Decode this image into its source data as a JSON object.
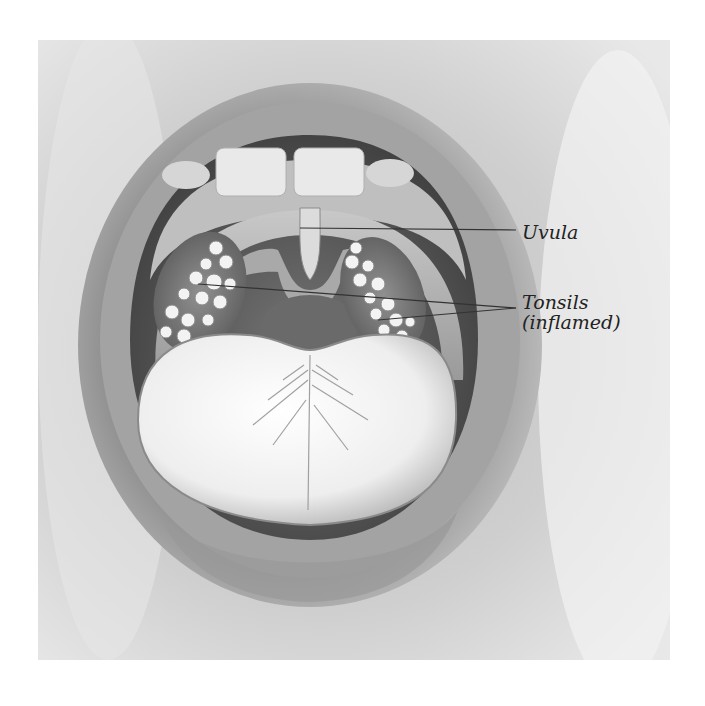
{
  "figure": {
    "style": "grayscale pencil illustration"
  },
  "labels": [
    {
      "id": "uvula",
      "text": "Uvula"
    },
    {
      "id": "tonsils",
      "line1": "Tonsils",
      "line2": "(inflamed)"
    }
  ],
  "colors": {
    "background": "#ffffff",
    "skin": "#d9d9d9",
    "lips": "#a8a8a8",
    "cavity": "#5a5a5a",
    "tongue": "#f4f4f4",
    "leader_line": "#333333"
  }
}
